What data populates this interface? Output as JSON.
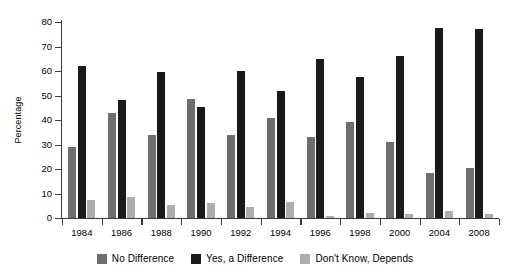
{
  "chart_data": {
    "type": "bar",
    "title": "",
    "xlabel": "",
    "ylabel": "Percentage",
    "categories": [
      "1984",
      "1986",
      "1988",
      "1990",
      "1992",
      "1994",
      "1996",
      "1998",
      "2000",
      "2004",
      "2008"
    ],
    "series": [
      {
        "name": "No Difference",
        "color": "#6e6e6e",
        "values": [
          29,
          43,
          34,
          48.5,
          34,
          41,
          33,
          39,
          31,
          18.5,
          20.5
        ]
      },
      {
        "name": "Yes, a Difference",
        "color": "#1a1a1a",
        "values": [
          62,
          48,
          59.5,
          45.5,
          60,
          52,
          65,
          57.5,
          66,
          77.5,
          77
        ]
      },
      {
        "name": "Don't Know, Depends",
        "color": "#adadad",
        "values": [
          7.5,
          8.5,
          5.5,
          6,
          4.5,
          6.5,
          1,
          2,
          1.5,
          3,
          1.5
        ]
      }
    ],
    "ylim": [
      0,
      80
    ],
    "ytick_labels": [
      "0",
      "10",
      "20",
      "30",
      "40",
      "50",
      "60",
      "70",
      "80"
    ],
    "ytick_values": [
      0,
      10,
      20,
      30,
      40,
      50,
      60,
      70,
      80
    ],
    "grid": false,
    "legend_position": "bottom"
  },
  "legend": {
    "items": [
      {
        "label": "No Difference",
        "color": "#6e6e6e"
      },
      {
        "label": "Yes, a Difference",
        "color": "#1a1a1a"
      },
      {
        "label": "Don't Know, Depends",
        "color": "#adadad"
      }
    ]
  }
}
